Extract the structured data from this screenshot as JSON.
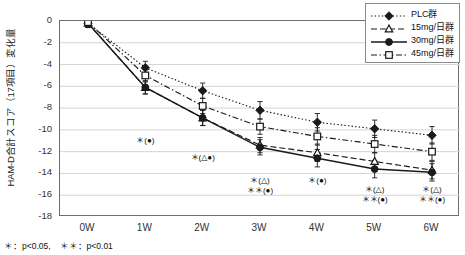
{
  "chart_data": {
    "type": "line",
    "title": "",
    "xlabel": "",
    "ylabel": "HAM-D合計スコア（17項目）変化量",
    "categories": [
      "0W",
      "1W",
      "2W",
      "3W",
      "4W",
      "5W",
      "6W"
    ],
    "ylim": [
      -18,
      0
    ],
    "yticks": [
      0,
      -2,
      -4,
      -6,
      -8,
      -10,
      -12,
      -14,
      -16,
      -18
    ],
    "ytick_labels": [
      "0",
      "-2",
      "-4",
      "-6",
      "-8",
      "-10",
      "-12",
      "-14",
      "-16",
      "-18"
    ],
    "grid": true,
    "legend_position": "top-right",
    "series": [
      {
        "name": "PLC群",
        "marker": "filled-diamond",
        "line_style": "dotted",
        "values": [
          -0.2,
          -4.3,
          -6.4,
          -8.2,
          -9.3,
          -9.9,
          -10.5
        ],
        "errors": [
          0.4,
          0.6,
          0.7,
          0.8,
          0.8,
          0.8,
          0.8
        ]
      },
      {
        "name": "15mg/日群",
        "marker": "open-triangle",
        "line_style": "dashed",
        "values": [
          -0.2,
          -6.1,
          -8.9,
          -11.4,
          -12.1,
          -12.9,
          -13.7
        ],
        "errors": [
          0.4,
          0.6,
          0.7,
          0.7,
          0.8,
          0.8,
          0.8
        ]
      },
      {
        "name": "30mg/日群",
        "marker": "filled-circle",
        "line_style": "solid",
        "values": [
          -0.2,
          -6.1,
          -8.9,
          -11.6,
          -12.6,
          -13.6,
          -13.9
        ],
        "errors": [
          0.4,
          0.6,
          0.7,
          0.7,
          0.8,
          0.8,
          0.8
        ]
      },
      {
        "name": "45mg/日群",
        "marker": "open-square",
        "line_style": "dash-dot",
        "values": [
          -0.1,
          -5.0,
          -7.8,
          -9.7,
          -10.6,
          -11.3,
          -12.0
        ],
        "errors": [
          0.4,
          0.6,
          0.7,
          0.7,
          0.8,
          0.8,
          0.8
        ]
      }
    ],
    "annotations": [
      {
        "category": "1W",
        "lines": [
          "＊(●)"
        ]
      },
      {
        "category": "2W",
        "lines": [
          "＊(△●)"
        ]
      },
      {
        "category": "3W",
        "lines": [
          "＊(△)",
          "＊＊(●)"
        ]
      },
      {
        "category": "4W",
        "lines": [
          "＊(●)"
        ]
      },
      {
        "category": "5W",
        "lines": [
          "＊(△)",
          "＊＊(●)"
        ]
      },
      {
        "category": "6W",
        "lines": [
          "＊(△)",
          "＊＊(●)"
        ]
      }
    ],
    "pvalue_note": "＊：p<0.05,　＊＊：p<0.01"
  },
  "legend": {
    "items": [
      {
        "label": "PLC群"
      },
      {
        "label": "15mg/日群"
      },
      {
        "label": "30mg/日群"
      },
      {
        "label": "45mg/日群"
      }
    ]
  },
  "colors": {
    "axis": "#6e6e6e",
    "grid": "#d4d4d4",
    "series": "#1a1a1a",
    "text": "#1a1a1a",
    "background": "#ffffff"
  }
}
